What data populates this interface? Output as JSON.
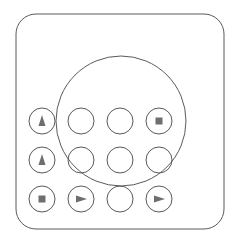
{
  "diagram": {
    "frame": {
      "x": 16,
      "y": 14,
      "width": 208,
      "height": 215,
      "radius": 20
    },
    "big_circle": {
      "cx": 121,
      "cy": 121,
      "r": 65
    },
    "stroke_color": "#5a5a5a",
    "glyph_color": "#6e6e6e",
    "button_radius": 13,
    "columns": [
      42,
      81,
      120,
      159
    ],
    "rows": [
      121,
      160,
      199
    ],
    "buttons": [
      {
        "row": 0,
        "col": 0,
        "icon": "triangle-up"
      },
      {
        "row": 0,
        "col": 1,
        "icon": "none"
      },
      {
        "row": 0,
        "col": 2,
        "icon": "none"
      },
      {
        "row": 0,
        "col": 3,
        "icon": "square"
      },
      {
        "row": 1,
        "col": 0,
        "icon": "triangle-up"
      },
      {
        "row": 1,
        "col": 1,
        "icon": "none"
      },
      {
        "row": 1,
        "col": 2,
        "icon": "none"
      },
      {
        "row": 1,
        "col": 3,
        "icon": "none"
      },
      {
        "row": 2,
        "col": 0,
        "icon": "square"
      },
      {
        "row": 2,
        "col": 1,
        "icon": "triangle-right"
      },
      {
        "row": 2,
        "col": 2,
        "icon": "none"
      },
      {
        "row": 2,
        "col": 3,
        "icon": "triangle-right"
      }
    ]
  }
}
